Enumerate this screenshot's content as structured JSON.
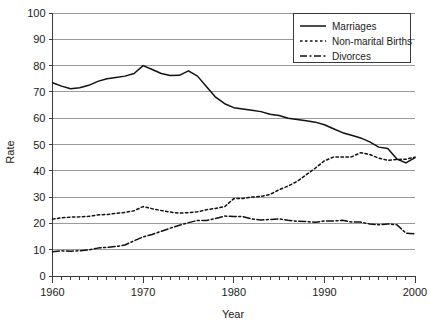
{
  "chart_data": {
    "type": "line",
    "title": "",
    "xlabel": "Year",
    "ylabel": "Rate",
    "xlim": [
      1960,
      2000
    ],
    "ylim": [
      0,
      100
    ],
    "grid": true,
    "legend_position": "top-right",
    "xticks": [
      1960,
      1970,
      1980,
      1990,
      2000
    ],
    "xtick_labels": [
      "1960",
      "1970",
      "1980",
      "1990",
      "2000"
    ],
    "minor_xtick_interval": 1,
    "yticks": [
      0,
      10,
      20,
      30,
      40,
      50,
      60,
      70,
      80,
      90,
      100
    ],
    "ytick_labels": [
      "0",
      "10",
      "20",
      "30",
      "40",
      "50",
      "60",
      "70",
      "80",
      "90",
      "100"
    ],
    "x": [
      1960,
      1961,
      1962,
      1963,
      1964,
      1965,
      1966,
      1967,
      1968,
      1969,
      1970,
      1971,
      1972,
      1973,
      1974,
      1975,
      1976,
      1977,
      1978,
      1979,
      1980,
      1981,
      1982,
      1983,
      1984,
      1985,
      1986,
      1987,
      1988,
      1989,
      1990,
      1991,
      1992,
      1993,
      1994,
      1995,
      1996,
      1997,
      1998,
      1999,
      2000
    ],
    "series": [
      {
        "name": "Marriages",
        "style": "solid",
        "color": "#111111",
        "values": [
          73.5,
          72.2,
          71.2,
          71.6,
          72.5,
          74.0,
          75.0,
          75.5,
          76.0,
          77.0,
          80.0,
          78.5,
          77.0,
          76.2,
          76.3,
          78.0,
          76.0,
          72.0,
          68.0,
          65.5,
          64.0,
          63.5,
          63.0,
          62.5,
          61.5,
          61.0,
          60.0,
          59.5,
          59.0,
          58.5,
          57.5,
          56.0,
          54.5,
          53.5,
          52.5,
          51.0,
          49.0,
          48.5,
          44.5,
          43.0,
          45.0
        ]
      },
      {
        "name": "Non-marital Births",
        "style": "dotted",
        "color": "#111111",
        "values": [
          21.6,
          22.1,
          22.4,
          22.5,
          22.7,
          23.2,
          23.4,
          23.8,
          24.2,
          24.8,
          26.4,
          25.6,
          24.9,
          24.3,
          23.9,
          24.1,
          24.4,
          25.2,
          25.7,
          26.4,
          29.4,
          29.5,
          30.0,
          30.3,
          31.0,
          32.8,
          34.2,
          36.0,
          38.5,
          41.0,
          43.8,
          45.2,
          45.2,
          45.3,
          46.9,
          46.2,
          44.8,
          44.0,
          44.3,
          44.4,
          45.2
        ]
      },
      {
        "name": "Divorces",
        "style": "dash-dot",
        "color": "#111111",
        "values": [
          9.2,
          9.6,
          9.4,
          9.6,
          9.9,
          10.6,
          10.9,
          11.2,
          11.8,
          13.4,
          14.9,
          15.8,
          17.0,
          18.2,
          19.3,
          20.3,
          21.1,
          21.1,
          21.9,
          22.8,
          22.6,
          22.6,
          21.7,
          21.3,
          21.5,
          21.7,
          21.2,
          20.8,
          20.7,
          20.4,
          20.9,
          20.9,
          21.2,
          20.5,
          20.5,
          19.8,
          19.5,
          19.8,
          19.5,
          16.3,
          16.0
        ]
      }
    ]
  }
}
